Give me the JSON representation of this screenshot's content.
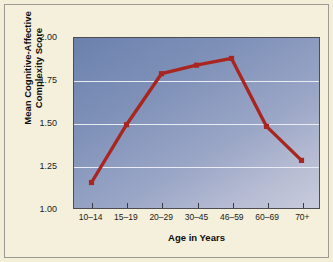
{
  "figure": {
    "background_color": "#f4f0dc",
    "frame_color": "#9a9a92"
  },
  "chart_data": {
    "type": "line",
    "title": "",
    "xlabel": "Age in Years",
    "ylabel_line1": "Mean Cognitive-Affective",
    "ylabel_line2": "Complexity Score",
    "ylabel": "Mean Cognitive-Affective Complexity Score",
    "categories": [
      "10–14",
      "15–19",
      "20–29",
      "30–45",
      "46–59",
      "60–69",
      "70+"
    ],
    "values": [
      1.15,
      1.49,
      1.79,
      1.84,
      1.88,
      1.48,
      1.28
    ],
    "ylim": [
      1.0,
      2.0
    ],
    "yticks": [
      "1.00",
      "1.25",
      "1.50",
      "1.75",
      "2.00"
    ],
    "ytick_values": [
      1.0,
      1.25,
      1.5,
      1.75,
      2.0
    ],
    "grid": true,
    "gridline_color": "#e9ecf4",
    "legend": "none",
    "series_color": "#a8261f",
    "marker": "square",
    "plot_background": "#8593bb"
  }
}
